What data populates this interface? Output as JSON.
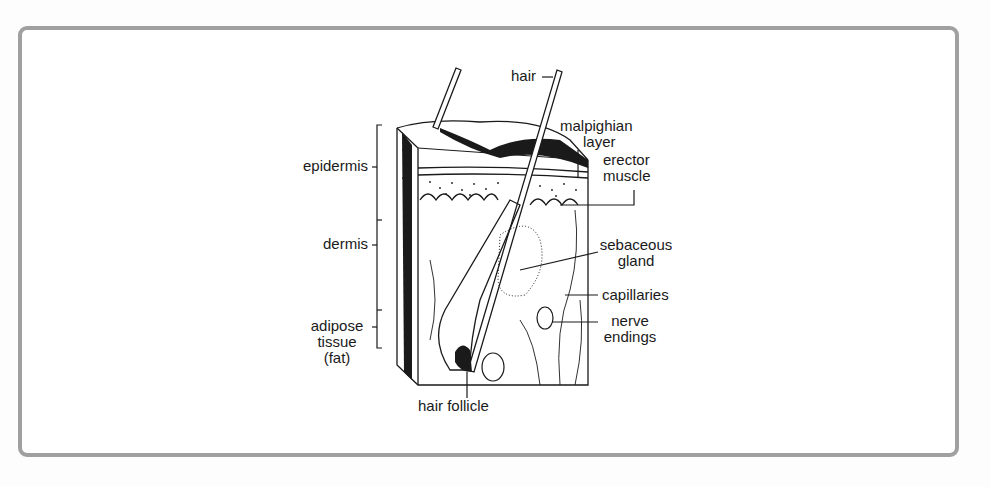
{
  "figure": {
    "labels_left": {
      "epidermis": "epidermis",
      "dermis": "dermis",
      "adipose_1": "adipose",
      "adipose_2": "tissue",
      "adipose_3": "(fat)"
    },
    "labels_right": {
      "hair": "hair",
      "malpighian_1": "malpighian",
      "malpighian_2": "layer",
      "erector_1": "erector",
      "erector_2": "muscle",
      "sebaceous_1": "sebaceous",
      "sebaceous_2": "gland",
      "capillaries": "capillaries",
      "nerve_1": "nerve",
      "nerve_2": "endings"
    },
    "labels_bottom": {
      "hair_follicle": "hair follicle"
    }
  },
  "colors": {
    "frame_border": "#a0a0a0",
    "ink": "#1a1a1a",
    "background": "#ffffff"
  }
}
